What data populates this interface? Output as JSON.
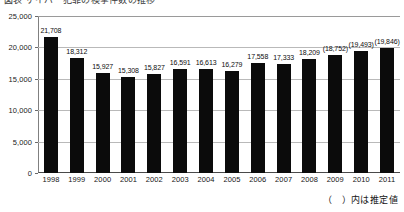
{
  "title_strip": {
    "text": "図表 サイバー犯罪の検挙件数の推移"
  },
  "footnote": {
    "text": "（　）内は推定値"
  },
  "chart_data": {
    "type": "bar",
    "title": "",
    "xlabel": "",
    "ylabel": "",
    "ylim": [
      0,
      25000
    ],
    "grid": true,
    "legend": "none",
    "categories": [
      "1998",
      "1999",
      "2000",
      "2001",
      "2002",
      "2003",
      "2004",
      "2005",
      "2006",
      "2007",
      "2008",
      "2009",
      "2010",
      "2011"
    ],
    "values": [
      21708,
      18312,
      15927,
      15308,
      15827,
      16591,
      16613,
      16279,
      17558,
      17333,
      18209,
      18752,
      19493,
      19846
    ],
    "data_labels": [
      "21,708",
      "18,312",
      "15,927",
      "15,308",
      "15,827",
      "16,591",
      "16,613",
      "16,279",
      "17,558",
      "17,333",
      "18,209",
      "(18,752)",
      "(19,493)",
      "(19,846)"
    ],
    "estimated": [
      false,
      false,
      false,
      false,
      false,
      false,
      false,
      false,
      false,
      false,
      false,
      true,
      true,
      true
    ],
    "ytick_values": [
      0,
      5000,
      10000,
      15000,
      20000,
      25000
    ],
    "ytick_labels": [
      "0",
      "5,000",
      "10,000",
      "15,000",
      "20,000",
      "25,000"
    ],
    "bar_color": "#0b0b0b",
    "grid_color": "#b9b9b9",
    "axis_color": "#4a4a4a"
  }
}
